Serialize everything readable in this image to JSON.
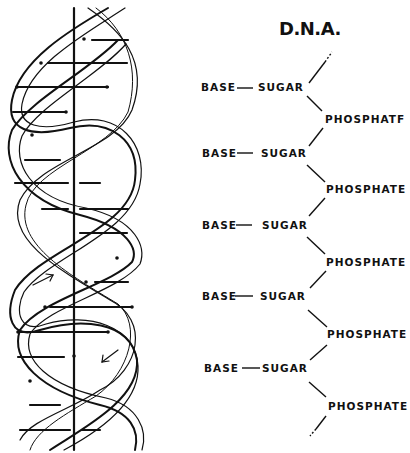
{
  "diagram": {
    "title": "D.N.A.",
    "helix": {
      "description": "double helix with base-pair rungs and central axis",
      "arrows": [
        "up-right arrow",
        "down-left arrow"
      ]
    },
    "chain": {
      "units": [
        {
          "base": "BASE",
          "sugar": "SUGAR",
          "phosphate": "PHOSPHATF"
        },
        {
          "base": "BASE",
          "sugar": "SUGAR",
          "phosphate": "PHOSPHATE"
        },
        {
          "base": "BASE",
          "sugar": "SUGAR",
          "phosphate": "PHOSPHATE"
        },
        {
          "base": "BASE",
          "sugar": "SUGAR",
          "phosphate": "PHOSPHATE"
        },
        {
          "base": "BASE",
          "sugar": "SUGAR",
          "phosphate": "PHOSPHATE"
        }
      ]
    }
  }
}
